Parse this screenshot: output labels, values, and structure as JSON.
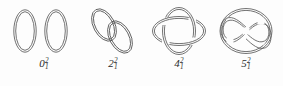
{
  "figure": {
    "background_color": "#fdfdfd",
    "stroke_color": "#5a5a5a",
    "label_color": "#2b2b2b"
  },
  "links": [
    {
      "id": "unlink",
      "name": "unlink",
      "label_base": "0",
      "label_superscript": "2",
      "label_subscript": "1",
      "crossing_number": "0",
      "component_count": "2",
      "description": "two disjoint unlinked circles"
    },
    {
      "id": "hopf-link",
      "name": "hopf-link",
      "label_base": "2",
      "label_superscript": "2",
      "label_subscript": "1",
      "crossing_number": "2",
      "component_count": "2",
      "description": "two interlocked tilted circles"
    },
    {
      "id": "torus-link-2-4",
      "name": "solomon-seal-link",
      "label_base": "4",
      "label_superscript": "2",
      "label_subscript": "1",
      "crossing_number": "4",
      "component_count": "2",
      "description": "horizontal and vertical ellipse with four crossings"
    },
    {
      "id": "whitehead-link",
      "name": "whitehead-link",
      "label_base": "5",
      "label_superscript": "2",
      "label_subscript": "1",
      "crossing_number": "5",
      "component_count": "2",
      "description": "figure-eight strand threaded through a ring"
    }
  ]
}
